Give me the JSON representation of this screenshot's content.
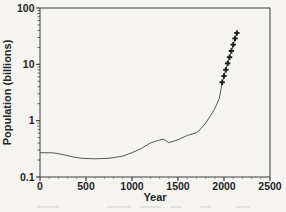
{
  "figure": {
    "background_color": "#f5f4f0",
    "ink_color": "#262626",
    "line_color": "#454545",
    "frame_color": "#3f3f3f",
    "marker_color": "#1f1f1f"
  },
  "chart_data": {
    "type": "line",
    "title": "",
    "xlabel": "Year",
    "ylabel": "Population (billions)",
    "x_range": [
      0,
      2500
    ],
    "x_ticks": [
      0,
      500,
      1000,
      1500,
      2000,
      2500
    ],
    "x_tick_labels": [
      "0",
      "500",
      "1000",
      "1500",
      "2000",
      "2500"
    ],
    "x_minor_tick_step": 100,
    "y_scale": "log",
    "y_range": [
      0.1,
      100
    ],
    "y_ticks": [
      0.1,
      1,
      10,
      100
    ],
    "y_tick_labels": [
      "0.1",
      "1",
      "10",
      "100"
    ],
    "grid": false,
    "legend": "none",
    "series": [
      {
        "name": "world-population-curve",
        "type": "line",
        "points": [
          [
            0,
            0.27
          ],
          [
            150,
            0.268
          ],
          [
            250,
            0.25
          ],
          [
            350,
            0.228
          ],
          [
            450,
            0.215
          ],
          [
            600,
            0.21
          ],
          [
            750,
            0.215
          ],
          [
            900,
            0.235
          ],
          [
            1000,
            0.27
          ],
          [
            1100,
            0.32
          ],
          [
            1200,
            0.4
          ],
          [
            1270,
            0.44
          ],
          [
            1340,
            0.47
          ],
          [
            1400,
            0.41
          ],
          [
            1450,
            0.43
          ],
          [
            1500,
            0.46
          ],
          [
            1600,
            0.545
          ],
          [
            1700,
            0.61
          ],
          [
            1750,
            0.72
          ],
          [
            1800,
            0.9
          ],
          [
            1850,
            1.2
          ],
          [
            1900,
            1.63
          ],
          [
            1950,
            2.5
          ],
          [
            1980,
            4.8
          ],
          [
            2000,
            6.2
          ],
          [
            2020,
            8.0
          ],
          [
            2040,
            10.4
          ],
          [
            2060,
            13.4
          ],
          [
            2080,
            17.3
          ],
          [
            2100,
            22.3
          ],
          [
            2120,
            28.8
          ],
          [
            2140,
            36
          ]
        ]
      },
      {
        "name": "projected-population-points",
        "type": "scatter",
        "marker": "plus",
        "points": [
          [
            1980,
            4.8
          ],
          [
            2000,
            6.2
          ],
          [
            2020,
            8.0
          ],
          [
            2040,
            10.4
          ],
          [
            2060,
            13.4
          ],
          [
            2080,
            17.3
          ],
          [
            2100,
            22.3
          ],
          [
            2120,
            28.8
          ],
          [
            2140,
            36
          ]
        ]
      }
    ]
  }
}
